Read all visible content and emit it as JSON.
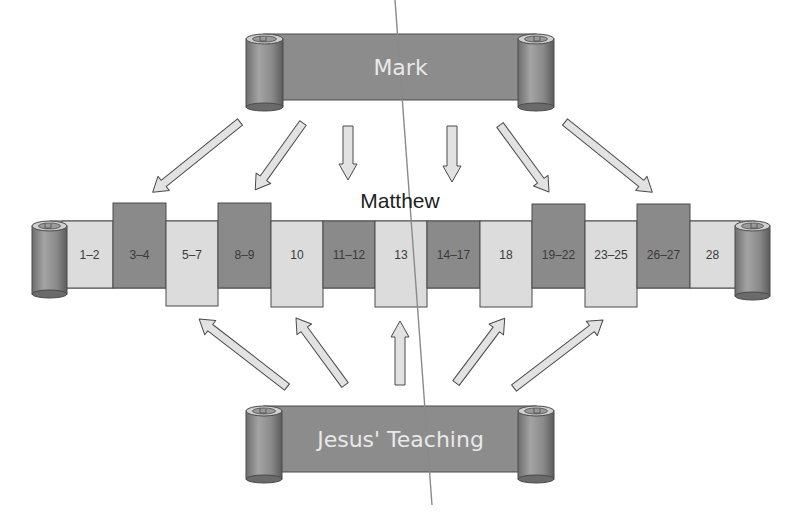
{
  "sources": {
    "top": {
      "label": "Mark"
    },
    "bottom": {
      "label": "Jesus' Teaching"
    }
  },
  "target": {
    "label": "Matthew",
    "sections": [
      {
        "chapters": "1–2",
        "source": "none",
        "shade": "light"
      },
      {
        "chapters": "3–4",
        "source": "Mark",
        "shade": "dark"
      },
      {
        "chapters": "5–7",
        "source": "Jesus' Teaching",
        "shade": "light"
      },
      {
        "chapters": "8–9",
        "source": "Mark",
        "shade": "dark"
      },
      {
        "chapters": "10",
        "source": "Jesus' Teaching",
        "shade": "light"
      },
      {
        "chapters": "11–12",
        "source": "none",
        "shade": "dark"
      },
      {
        "chapters": "13",
        "source": "Jesus' Teaching",
        "shade": "light"
      },
      {
        "chapters": "14–17",
        "source": "none",
        "shade": "dark"
      },
      {
        "chapters": "18",
        "source": "Jesus' Teaching",
        "shade": "light"
      },
      {
        "chapters": "19–22",
        "source": "Mark",
        "shade": "dark"
      },
      {
        "chapters": "23–25",
        "source": "Jesus' Teaching",
        "shade": "light"
      },
      {
        "chapters": "26–27",
        "source": "Mark",
        "shade": "dark"
      },
      {
        "chapters": "28",
        "source": "none",
        "shade": "light"
      }
    ]
  },
  "colors": {
    "dark_block": "#8a8a8a",
    "light_block": "#dcdcdc",
    "banner": "#8c8c8c",
    "outline": "#4a4a4a",
    "arrow_fill": "#e2e2e2"
  }
}
